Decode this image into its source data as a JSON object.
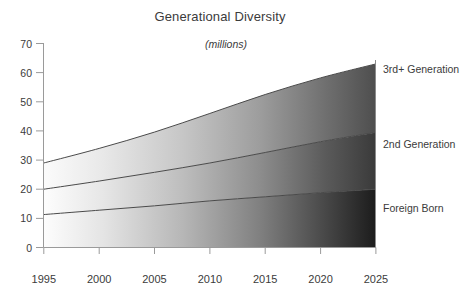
{
  "chart_data": {
    "type": "area",
    "stacked": true,
    "title": "Generational Diversity",
    "subtitle": "(millions)",
    "xlabel": "",
    "ylabel": "",
    "units": "millions",
    "x": [
      1995,
      2000,
      2005,
      2010,
      2015,
      2020,
      2025
    ],
    "categories": [
      "1995",
      "2000",
      "2005",
      "2010",
      "2015",
      "2020",
      "2025"
    ],
    "xlim": [
      1995,
      2025
    ],
    "ylim": [
      0,
      70
    ],
    "y_ticks": [
      0,
      10,
      20,
      30,
      40,
      50,
      60,
      70
    ],
    "y_tick_labels": [
      "0",
      "10",
      "20",
      "30",
      "40",
      "50",
      "60",
      "70"
    ],
    "x_ticks": [
      1995,
      2000,
      2005,
      2010,
      2015,
      2020,
      2025
    ],
    "x_tick_labels": [
      "1995",
      "2000",
      "2005",
      "2010",
      "2015",
      "2020",
      "2025"
    ],
    "grid": false,
    "legend_position": "right-inline",
    "series": [
      {
        "name": "Foreign Born",
        "label": "Foreign Born",
        "label_value_at_end": 20.0,
        "values": [
          11.3,
          12.8,
          14.3,
          16.0,
          17.4,
          18.8,
          20.0
        ],
        "cumulative": [
          11.3,
          12.8,
          14.3,
          16.0,
          17.4,
          18.8,
          20.0
        ]
      },
      {
        "name": "2nd Generation",
        "label": "2nd Generation",
        "label_value_at_end": 19.5,
        "values": [
          8.7,
          10.0,
          11.5,
          13.0,
          15.2,
          17.5,
          19.5
        ],
        "cumulative": [
          20.0,
          22.8,
          25.8,
          29.0,
          32.6,
          36.3,
          39.5
        ]
      },
      {
        "name": "3rd+ Generation",
        "label": "3rd+ Generation",
        "label_value_at_end": 23.5,
        "values": [
          9.0,
          11.2,
          13.8,
          17.0,
          19.9,
          21.9,
          23.5
        ],
        "cumulative": [
          29.0,
          34.0,
          39.6,
          46.0,
          52.5,
          58.2,
          63.0
        ]
      }
    ],
    "colors": {
      "background": "#ffffff",
      "text": "#3b3b3b",
      "axis": "#9a9a9a",
      "boundary_line": "#4a4a4a",
      "gradient_start": "#ffffff",
      "gradient_end": "#000000"
    }
  },
  "labels": {
    "title": "Generational Diversity",
    "subtitle": "(millions)",
    "y_0": "0",
    "y_10": "10",
    "y_20": "20",
    "y_30": "30",
    "y_40": "40",
    "y_50": "50",
    "y_60": "60",
    "y_70": "70",
    "x_1995": "1995",
    "x_2000": "2000",
    "x_2005": "2005",
    "x_2010": "2010",
    "x_2015": "2015",
    "x_2020": "2020",
    "x_2025": "2025",
    "series_top": "3rd+ Generation",
    "series_mid": "2nd Generation",
    "series_bottom": "Foreign Born"
  }
}
